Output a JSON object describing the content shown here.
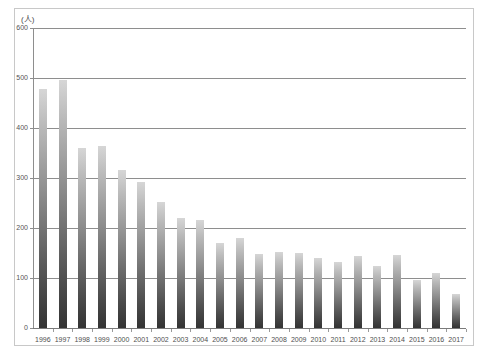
{
  "chart_data": {
    "type": "bar",
    "title": "",
    "subtitle": "",
    "xlabel": "",
    "ylabel": "(人)",
    "unit_label": "(人)",
    "ylim": [
      0,
      600
    ],
    "y_ticks": [
      0,
      100,
      200,
      300,
      400,
      500,
      600
    ],
    "y_tick_labels": [
      "0",
      "100",
      "200",
      "300",
      "400",
      "500",
      "600"
    ],
    "grid": true,
    "grid_axis": "y",
    "legend": false,
    "legend_position": "none",
    "categories": [
      "1996",
      "1997",
      "1998",
      "1999",
      "2000",
      "2001",
      "2002",
      "2003",
      "2004",
      "2005",
      "2006",
      "2007",
      "2008",
      "2009",
      "2010",
      "2011",
      "2012",
      "2013",
      "2014",
      "2015",
      "2016",
      "2017"
    ],
    "values": [
      478,
      496,
      360,
      364,
      316,
      292,
      252,
      220,
      216,
      170,
      180,
      148,
      152,
      150,
      140,
      132,
      144,
      124,
      146,
      96,
      110,
      68
    ],
    "bar_color_top": "#d6d6d6",
    "bar_color_bottom": "#333333",
    "grid_color": "#8e8e8e",
    "axis_color": "#8e8e8e",
    "frame_color": "#c8c8c8",
    "background": "#ffffff"
  }
}
